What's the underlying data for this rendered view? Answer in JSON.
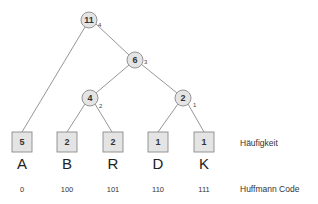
{
  "diagram": {
    "type": "huffman-tree",
    "colors": {
      "node_fill": "#e4e4e4",
      "node_stroke": "#8a8a8a",
      "edge": "#8a8a8a",
      "text": "#333333"
    },
    "internal_nodes": [
      {
        "id": "n11",
        "weight": "11",
        "rank": "4",
        "cx": 89,
        "cy": 20
      },
      {
        "id": "n6",
        "weight": "6",
        "rank": "3",
        "cx": 135,
        "cy": 60
      },
      {
        "id": "n4",
        "weight": "4",
        "rank": "2",
        "cx": 90,
        "cy": 98
      },
      {
        "id": "n2",
        "weight": "2",
        "rank": "1",
        "cx": 183,
        "cy": 98
      }
    ],
    "leaves": [
      {
        "symbol": "A",
        "frequency": "5",
        "code": "0",
        "x": 12
      },
      {
        "symbol": "B",
        "frequency": "2",
        "code": "100",
        "x": 57
      },
      {
        "symbol": "R",
        "frequency": "2",
        "code": "101",
        "x": 103
      },
      {
        "symbol": "D",
        "frequency": "1",
        "code": "110",
        "x": 148
      },
      {
        "symbol": "K",
        "frequency": "1",
        "code": "111",
        "x": 194
      }
    ],
    "row_labels": {
      "frequency": "Häufigkeit",
      "code": "Huffmann Code"
    }
  }
}
